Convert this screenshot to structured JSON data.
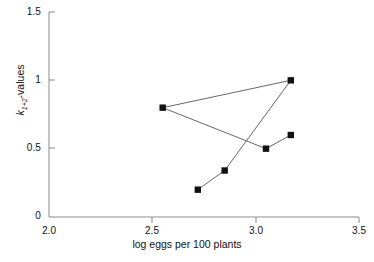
{
  "chart_data": {
    "type": "line",
    "title": "",
    "xlabel": "log eggs per 100 plants",
    "ylabel": "k1+2-values",
    "ylabel_parts": {
      "symbol": "k",
      "subscript": "1+2",
      "suffix": "-values"
    },
    "xlim": [
      2.0,
      3.5
    ],
    "ylim": [
      0,
      1.5
    ],
    "xticks": [
      2.0,
      2.5,
      3.0,
      3.5
    ],
    "xtick_labels": [
      "2.0",
      "2.5",
      "3.0",
      "3.5"
    ],
    "yticks": [
      0,
      0.5,
      1,
      1.5
    ],
    "ytick_labels": [
      "0",
      "0.5",
      "1",
      "1.5"
    ],
    "grid": false,
    "legend": null,
    "marker": "filled-square",
    "marker_color": "#111111",
    "line_color": "#555555",
    "series": [
      {
        "name": "k1+2 trajectory",
        "x": [
          2.72,
          2.85,
          3.17,
          2.55,
          3.05,
          3.17
        ],
        "y": [
          0.2,
          0.34,
          1.0,
          0.8,
          0.5,
          0.6
        ]
      }
    ],
    "points": [
      {
        "x": 2.72,
        "y": 0.2
      },
      {
        "x": 2.85,
        "y": 0.34
      },
      {
        "x": 3.17,
        "y": 1.0
      },
      {
        "x": 2.55,
        "y": 0.8
      },
      {
        "x": 3.05,
        "y": 0.5
      },
      {
        "x": 3.17,
        "y": 0.6
      }
    ],
    "annotations": []
  },
  "axes": {
    "x_tick_labels": [
      "2.0",
      "2.5",
      "3.0",
      "3.5"
    ],
    "y_tick_labels": [
      "1.5",
      "1",
      "0.5",
      "0"
    ],
    "x_axis_label": "log eggs per 100 plants",
    "y_axis_symbol": "k",
    "y_axis_subscript": "1+2",
    "y_axis_suffix": "-values"
  },
  "colors": {
    "axis": "#8a8a8a",
    "line": "#555555",
    "marker": "#111111",
    "text": "#111111",
    "background": "#ffffff"
  }
}
